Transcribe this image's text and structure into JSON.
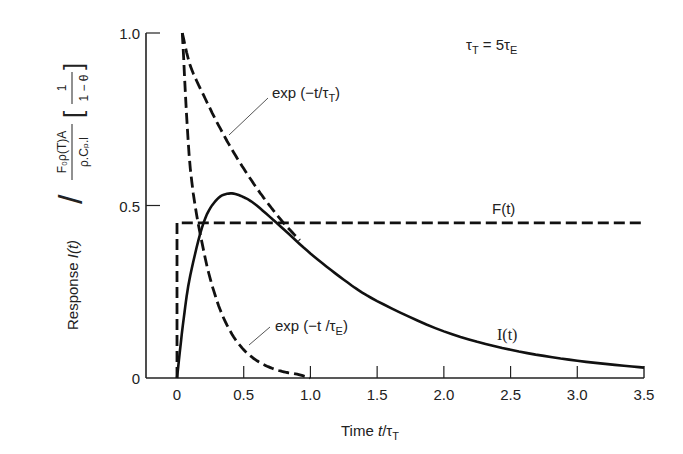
{
  "chart_data": {
    "type": "line",
    "title": "",
    "xlabel": "Time t/τT",
    "ylabel": "Response I(t) / [F₀ρ(T)A / ρ.Cₚ.l] [1/(1−θ)]",
    "xlim": [
      0,
      3.5
    ],
    "ylim": [
      0,
      1.0
    ],
    "grid": false,
    "legend": "none (inline annotations)",
    "x_ticks": [
      0,
      0.5,
      1.0,
      1.5,
      2.0,
      2.5,
      3.0,
      3.5
    ],
    "x_tick_labels": [
      "0",
      "0.5",
      "1.0",
      "1.5",
      "2.0",
      "2.5",
      "3.0",
      "3.5"
    ],
    "y_ticks": [
      0,
      0.5,
      1.0
    ],
    "y_tick_labels": [
      "0",
      "0.5",
      "1.0"
    ],
    "annotation": "τT = 5τE",
    "series": [
      {
        "name": "exp(−t/τT)",
        "style": "dashed",
        "x": [
          0.04,
          0.1,
          0.2,
          0.3,
          0.4,
          0.5,
          0.6,
          0.7,
          0.8,
          0.92
        ],
        "values": [
          1.0,
          0.905,
          0.819,
          0.741,
          0.67,
          0.607,
          0.549,
          0.497,
          0.449,
          0.399
        ]
      },
      {
        "name": "exp(−t/τE)",
        "style": "dashed",
        "x": [
          0.04,
          0.1,
          0.2,
          0.3,
          0.4,
          0.5,
          0.6,
          0.7,
          0.8,
          0.9,
          1.0
        ],
        "values": [
          1.0,
          0.607,
          0.368,
          0.223,
          0.135,
          0.082,
          0.05,
          0.03,
          0.018,
          0.011,
          0.0
        ]
      },
      {
        "name": "F(t)",
        "style": "dashed",
        "x": [
          0,
          0,
          3.5
        ],
        "values": [
          0,
          0.45,
          0.45
        ]
      },
      {
        "name": "I(t)",
        "style": "solid",
        "x": [
          0,
          0.05,
          0.1,
          0.2,
          0.3,
          0.4,
          0.5,
          0.6,
          0.8,
          1.0,
          1.25,
          1.5,
          2.0,
          2.5,
          3.0,
          3.5
        ],
        "values": [
          0,
          0.172,
          0.298,
          0.451,
          0.518,
          0.535,
          0.524,
          0.499,
          0.431,
          0.361,
          0.285,
          0.223,
          0.135,
          0.082,
          0.05,
          0.03
        ]
      }
    ],
    "labels": {
      "exp_tT": "exp (−t/τT)",
      "exp_tE": "exp (−t/τE)",
      "F": "F(t)",
      "I": "I(t)"
    }
  },
  "axis_text": {
    "x_title_prefix": "Time ",
    "x_title_var": "t",
    "x_title_sep": "/τ",
    "x_title_sub": "T",
    "y_title_prefix": "Response ",
    "y_title_var": "I(t)",
    "y_frac_num": "F₀ρ(T)A",
    "y_frac_den": "ρ.Cₚ.l",
    "y_bracket_num": "1",
    "y_bracket_den": "1 − θ"
  },
  "annotation_text": {
    "tau": "τ",
    "sub_T": "T",
    "eq": " = 5τ",
    "sub_E": "E"
  },
  "curve_labels": {
    "expT_main": "exp (−t/τ",
    "expT_sub": "T",
    "expE_main": "exp (−t /τ",
    "expE_sub": "E",
    "close": ")",
    "F": "F(t)",
    "I": "I(t)"
  }
}
